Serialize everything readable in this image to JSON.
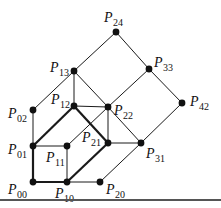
{
  "diagram": {
    "type": "lattice-graph",
    "nodes": [
      {
        "id": "P24",
        "base": "P",
        "sub": "24",
        "x": 116,
        "y": 32,
        "lx": 104,
        "ly": 22
      },
      {
        "id": "P13",
        "base": "P",
        "sub": "13",
        "x": 74,
        "y": 71,
        "lx": 50,
        "ly": 72
      },
      {
        "id": "P33",
        "base": "P",
        "sub": "33",
        "x": 149,
        "y": 69,
        "lx": 154,
        "ly": 67
      },
      {
        "id": "P02",
        "base": "P",
        "sub": "02",
        "x": 33,
        "y": 110,
        "lx": 8,
        "ly": 118
      },
      {
        "id": "P12",
        "base": "P",
        "sub": "12",
        "x": 74,
        "y": 106,
        "lx": 51,
        "ly": 104
      },
      {
        "id": "P22",
        "base": "P",
        "sub": "22",
        "x": 108,
        "y": 107,
        "lx": 114,
        "ly": 115
      },
      {
        "id": "P42",
        "base": "P",
        "sub": "42",
        "x": 182,
        "y": 103,
        "lx": 190,
        "ly": 106
      },
      {
        "id": "P01",
        "base": "P",
        "sub": "01",
        "x": 33,
        "y": 146,
        "lx": 8,
        "ly": 154
      },
      {
        "id": "P11",
        "base": "P",
        "sub": "11",
        "x": 67,
        "y": 146,
        "lx": 46,
        "ly": 162
      },
      {
        "id": "P21",
        "base": "P",
        "sub": "21",
        "x": 108,
        "y": 143,
        "lx": 82,
        "ly": 142
      },
      {
        "id": "P31",
        "base": "P",
        "sub": "31",
        "x": 141,
        "y": 143,
        "lx": 146,
        "ly": 158
      },
      {
        "id": "P00",
        "base": "P",
        "sub": "00",
        "x": 33,
        "y": 182,
        "lx": 8,
        "ly": 194
      },
      {
        "id": "P10",
        "base": "P",
        "sub": "10",
        "x": 67,
        "y": 182,
        "lx": 55,
        "ly": 198
      },
      {
        "id": "P20",
        "base": "P",
        "sub": "20",
        "x": 100,
        "y": 182,
        "lx": 106,
        "ly": 194
      }
    ],
    "edges": [
      {
        "from": "P24",
        "to": "P13",
        "bold": false
      },
      {
        "from": "P24",
        "to": "P33",
        "bold": false
      },
      {
        "from": "P33",
        "to": "P42",
        "bold": false
      },
      {
        "from": "P33",
        "to": "P22",
        "bold": false
      },
      {
        "from": "P42",
        "to": "P31",
        "bold": false
      },
      {
        "from": "P13",
        "to": "P02",
        "bold": false
      },
      {
        "from": "P13",
        "to": "P12",
        "bold": false
      },
      {
        "from": "P13",
        "to": "P22",
        "bold": false
      },
      {
        "from": "P02",
        "to": "P01",
        "bold": false
      },
      {
        "from": "P12",
        "to": "P22",
        "bold": false
      },
      {
        "from": "P12",
        "to": "P01",
        "bold": true
      },
      {
        "from": "P12",
        "to": "P21",
        "bold": true
      },
      {
        "from": "P22",
        "to": "P21",
        "bold": false
      },
      {
        "from": "P22",
        "to": "P11",
        "bold": false
      },
      {
        "from": "P22",
        "to": "P31",
        "bold": false
      },
      {
        "from": "P21",
        "to": "P31",
        "bold": false
      },
      {
        "from": "P21",
        "to": "P10",
        "bold": true
      },
      {
        "from": "P01",
        "to": "P11",
        "bold": false
      },
      {
        "from": "P01",
        "to": "P00",
        "bold": true
      },
      {
        "from": "P11",
        "to": "P10",
        "bold": false
      },
      {
        "from": "P00",
        "to": "P10",
        "bold": true
      },
      {
        "from": "P10",
        "to": "P20",
        "bold": false
      },
      {
        "from": "P20",
        "to": "P31",
        "bold": false
      }
    ],
    "colors": {
      "line": "#1a1a1a",
      "node": "#111111",
      "rule": "#555555"
    }
  }
}
